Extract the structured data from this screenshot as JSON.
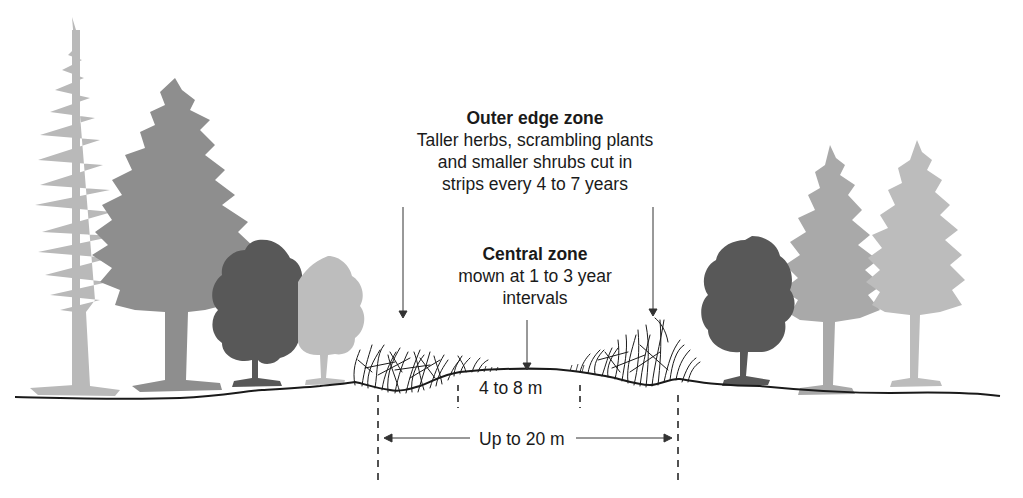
{
  "diagram": {
    "outer_zone": {
      "title": "Outer edge zone",
      "lines": [
        "Taller herbs, scrambling plants",
        "and smaller shrubs cut in",
        "strips every 4 to 7 years"
      ]
    },
    "central_zone": {
      "title": "Central zone",
      "lines": [
        "mown at 1 to 3 year",
        "intervals"
      ]
    },
    "dimensions": {
      "inner_width": "4 to 8 m",
      "outer_width": "Up to 20 m"
    },
    "colors": {
      "ink": "#1a1a1a",
      "conifer_light": "#b9b9b9",
      "conifer_mid": "#8e8e8e",
      "broadleaf_dark": "#585858",
      "broadleaf_light": "#bdbdbd",
      "background": "#ffffff"
    },
    "elements": {
      "left_trees": [
        "tall-conifer-light",
        "conifer-mid",
        "broadleaf-dark",
        "broadleaf-light"
      ],
      "right_trees": [
        "broadleaf-dark",
        "conifer-light",
        "conifer-light"
      ],
      "vegetation": [
        "left-scrub-zone",
        "central-mown-zone",
        "right-scrub-zone"
      ]
    }
  }
}
